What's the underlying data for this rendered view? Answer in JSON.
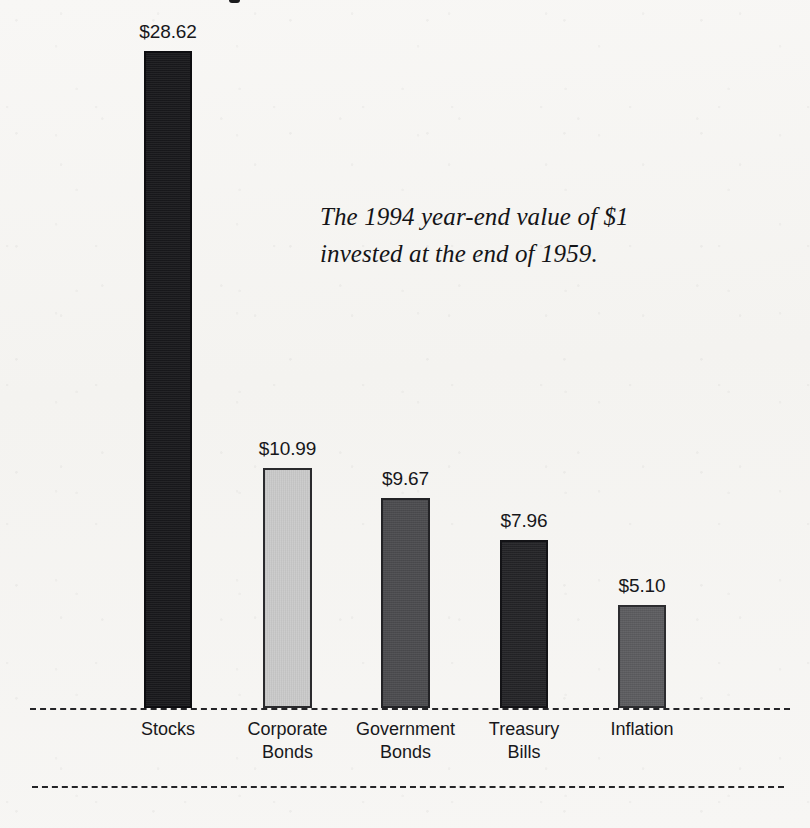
{
  "caption": {
    "text": "The 1994 year-end value of $1\ninvested at the end of 1959."
  },
  "chart_data": {
    "type": "bar",
    "title": "",
    "subtitle": "The 1994 year-end value of $1 invested at the end of 1959.",
    "xlabel": "",
    "ylabel": "",
    "ylim": [
      0,
      30
    ],
    "grid": false,
    "legend": "none",
    "categories": [
      "Stocks",
      "Corporate Bonds",
      "Government Bonds",
      "Treasury Bills",
      "Inflation"
    ],
    "values": [
      28.62,
      10.99,
      9.67,
      7.96,
      5.1
    ],
    "data_labels": [
      "$28.62",
      "$10.99",
      "$9.67",
      "$7.96",
      "$5.10"
    ],
    "bars": [
      {
        "category": "Stocks",
        "category_lines": "Stocks",
        "value": 28.62,
        "label": "$28.62",
        "fill": "#18181b",
        "stroke": "#0d0d10",
        "x": 144,
        "width": 48,
        "top": 51
      },
      {
        "category": "Corporate Bonds",
        "category_lines": "Corporate\nBonds",
        "value": 10.99,
        "label": "$10.99",
        "fill": "#cacaca",
        "stroke": "#2a2a2d",
        "x": 263,
        "width": 49,
        "top": 468
      },
      {
        "category": "Government Bonds",
        "category_lines": "Government\nBonds",
        "value": 9.67,
        "label": "$9.67",
        "fill": "#4b4b4e",
        "stroke": "#232326",
        "x": 381,
        "width": 49,
        "top": 498
      },
      {
        "category": "Treasury Bills",
        "category_lines": "Treasury\nBills",
        "value": 7.96,
        "label": "$7.96",
        "fill": "#232326",
        "stroke": "#131316",
        "x": 500,
        "width": 48,
        "top": 540
      },
      {
        "category": "Inflation",
        "category_lines": "Inflation",
        "value": 5.1,
        "label": "$5.10",
        "fill": "#5c5c5f",
        "stroke": "#2c2c2f",
        "x": 618,
        "width": 48,
        "top": 605
      }
    ],
    "baseline_y": 708,
    "colors": {
      "background": "#f6f5f3",
      "text": "#18181b",
      "rule": "#242427"
    }
  }
}
